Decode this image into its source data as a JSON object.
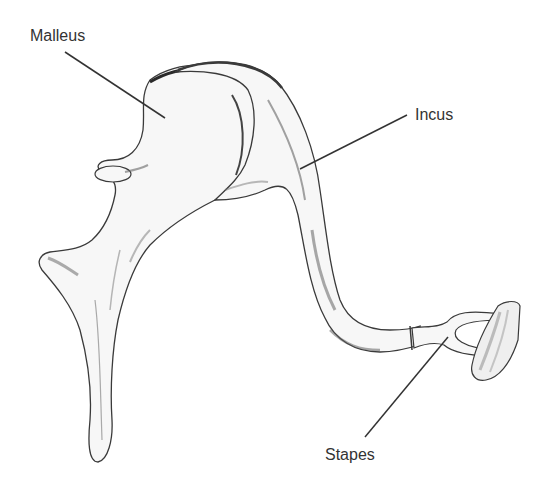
{
  "diagram": {
    "style": "grayscale pencil anatomical sketch",
    "labels": [
      {
        "id": "malleus",
        "text": "Malleus",
        "x": 30,
        "y": 28,
        "leader": {
          "x1": 65,
          "y1": 52,
          "x2": 165,
          "y2": 118
        }
      },
      {
        "id": "incus",
        "text": "Incus",
        "x": 415,
        "y": 107,
        "leader": {
          "x1": 407,
          "y1": 115,
          "x2": 300,
          "y2": 169
        }
      },
      {
        "id": "stapes",
        "text": "Stapes",
        "x": 325,
        "y": 446,
        "leader": {
          "x1": 365,
          "y1": 437,
          "x2": 448,
          "y2": 337
        }
      }
    ],
    "colors": {
      "background": "#ffffff",
      "outline": "#3a3a3a",
      "shading": "#6e6e6e",
      "bone_fill": "#f7f7f7",
      "label_text": "#333333",
      "leader_line": "#333333"
    }
  }
}
